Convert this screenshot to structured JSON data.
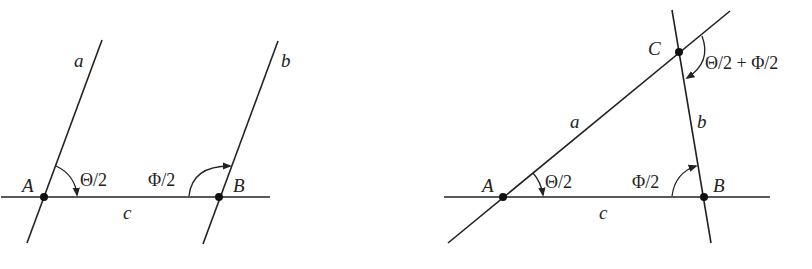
{
  "left_diagram": {
    "labels": {
      "side_a": "a",
      "side_b": "b",
      "side_c": "c",
      "vertex_A": "A",
      "vertex_B": "B",
      "angle_A": "Θ/2",
      "angle_B": "Φ/2"
    },
    "description": "Two parallel lines a and b crossing base line c at points A and B"
  },
  "right_diagram": {
    "labels": {
      "side_a": "a",
      "side_b": "b",
      "side_c": "c",
      "vertex_A": "A",
      "vertex_B": "B",
      "vertex_C": "C",
      "angle_A": "Θ/2",
      "angle_B": "Φ/2",
      "angle_C": "Θ/2 + Φ/2"
    },
    "description": "Lines a and b meet at C forming triangle ABC with base c"
  },
  "colors": {
    "stroke": "#222222",
    "background": "#ffffff"
  }
}
